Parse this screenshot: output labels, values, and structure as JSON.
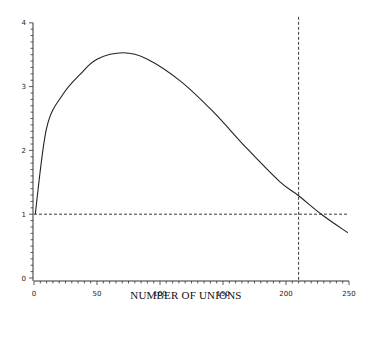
{
  "chart_data": {
    "type": "line",
    "title": "",
    "xlabel": "NUMBER OF UNIONS",
    "ylabel": "",
    "xlim": [
      0,
      250
    ],
    "ylim": [
      0,
      4
    ],
    "x_ticks": [
      0,
      50,
      100,
      150,
      200,
      250
    ],
    "y_ticks": [
      0,
      1,
      2,
      3,
      4
    ],
    "grid": false,
    "legend": null,
    "series": [
      {
        "name": "curve",
        "style": "solid",
        "x": [
          1,
          10,
          23,
          37,
          50,
          71,
          90,
          116,
          142,
          169,
          195,
          210,
          228,
          249
        ],
        "y": [
          1.0,
          2.35,
          2.88,
          3.2,
          3.43,
          3.53,
          3.43,
          3.09,
          2.61,
          2.03,
          1.51,
          1.29,
          1.0,
          0.71
        ]
      }
    ],
    "reference_lines": [
      {
        "orientation": "horizontal",
        "value": 1,
        "style": "dashed"
      },
      {
        "orientation": "vertical",
        "value": 210,
        "style": "dashed"
      }
    ]
  },
  "labels": {
    "xlabel": "NUMBER OF UNIONS",
    "x_tick_labels": [
      "0",
      "50",
      "100",
      "150",
      "200",
      "250"
    ],
    "y_tick_labels": [
      "0",
      "1",
      "2",
      "3",
      "4"
    ]
  }
}
